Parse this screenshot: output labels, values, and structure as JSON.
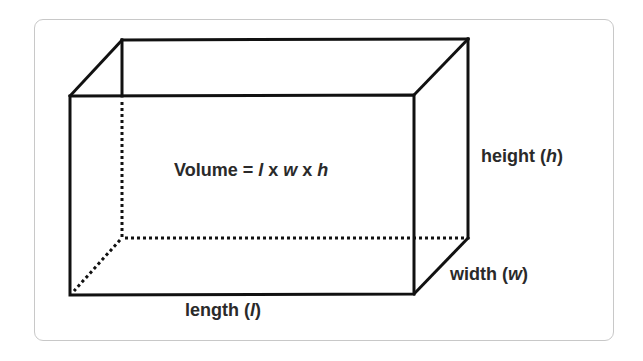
{
  "diagram": {
    "type": "rectangular-prism",
    "formula": {
      "prefix": "Volume = ",
      "var_l": "l",
      "op1": " x ",
      "var_w": "w",
      "op2": " x ",
      "var_h": "h"
    },
    "labels": {
      "height": {
        "word": "height (",
        "var": "h",
        "close": ")"
      },
      "width": {
        "word": "width (",
        "var": "w",
        "close": ")"
      },
      "length": {
        "word": "length (",
        "var": "l",
        "close": ")"
      }
    },
    "vertices": {
      "front_top_left": [
        70,
        96
      ],
      "front_top_right": [
        414,
        95
      ],
      "front_bottom_left": [
        70,
        295
      ],
      "front_bottom_right": [
        414,
        294
      ],
      "back_top_left": [
        122,
        40
      ],
      "back_top_right": [
        468,
        39
      ],
      "back_bottom_left": [
        122,
        238
      ],
      "back_bottom_right": [
        468,
        238
      ]
    },
    "colors": {
      "edge": "#111111",
      "text": "#2a2a2a",
      "frame_border": "#c8c8c8",
      "background": "#ffffff"
    }
  }
}
